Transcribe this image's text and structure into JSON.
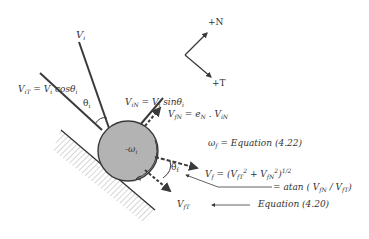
{
  "diagram": {
    "axes": {
      "normal_label": "+N",
      "tangent_label": "+T"
    },
    "incident": {
      "velocity": "V",
      "velocity_sub": "i",
      "tangential_eq": "V",
      "tangential_sub": "iT",
      "tangential_rhs": " = V",
      "tangential_rhs_sub": "i",
      "tangential_fn": " cosθ",
      "tangential_fn_sub": "i",
      "normal_eq": "V",
      "normal_sub": "iN",
      "normal_rhs": " = V",
      "normal_rhs_sub": "i",
      "normal_fn": " sinθ",
      "normal_fn_sub": "i",
      "angle": "θ",
      "angle_sub": "i"
    },
    "ball": {
      "spin_label": "-ω",
      "spin_sub": "i",
      "fill": "#b3b3b3"
    },
    "final": {
      "normal_label": "V",
      "normal_sub": "fN",
      "normal_rhs": " = e",
      "normal_rhs_sub": "N",
      "normal_rhs2": " . V",
      "normal_rhs2_sub": "iN",
      "spin_label": "ω",
      "spin_sub": "f",
      "spin_rhs": " = Equation (4.22)",
      "velocity_label": "V",
      "velocity_sub": "f",
      "velocity_rhs": " = (V",
      "velocity_t_sub": "fT",
      "velocity_plus": " + V",
      "velocity_n_sub": "fN",
      "velocity_close": ")",
      "velocity_exp": "1/2",
      "sq": "2",
      "angle": "θ",
      "angle_sub": "f",
      "angle_rhs": "= atan ( V",
      "angle_rhs_sub1": "fN",
      "angle_rhs_mid": " / V",
      "angle_rhs_sub2": "fT",
      "angle_rhs_close": ")",
      "tangential_label": "V",
      "tangential_sub": "fT",
      "tangential_rhs": "Equation (4.20)"
    },
    "colors": {
      "line": "#3a3a3a",
      "ball": "#b3b3b3",
      "hatch": "#888888"
    }
  }
}
